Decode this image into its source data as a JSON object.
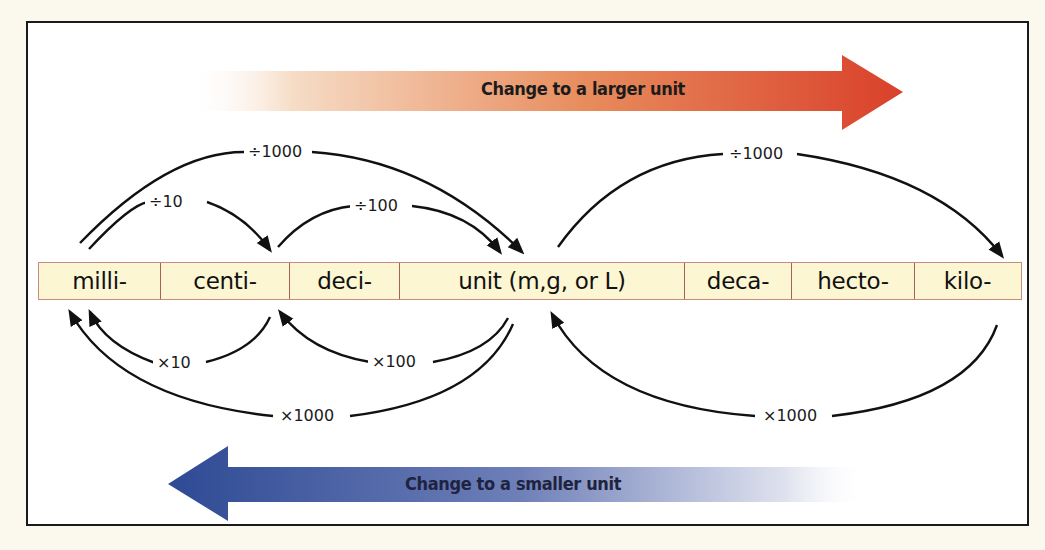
{
  "title_arrows": {
    "larger": {
      "label": "Change to a larger unit",
      "color": "#d9432a",
      "direction": "right"
    },
    "smaller": {
      "label": "Change to a smaller unit",
      "color": "#2e4a94",
      "direction": "left"
    }
  },
  "units": [
    {
      "label": "milli-"
    },
    {
      "label": "centi-"
    },
    {
      "label": "deci-"
    },
    {
      "label": "unit (m,g, or L)"
    },
    {
      "label": "deca-"
    },
    {
      "label": "hecto-"
    },
    {
      "label": "kilo-"
    }
  ],
  "conversions_top": [
    {
      "label": "÷1000",
      "from": "milli-",
      "to": "unit"
    },
    {
      "label": "÷10",
      "from": "milli-",
      "to": "centi-"
    },
    {
      "label": "÷100",
      "from": "centi-",
      "to": "unit"
    },
    {
      "label": "÷1000",
      "from": "unit",
      "to": "kilo-"
    }
  ],
  "conversions_bottom": [
    {
      "label": "×10",
      "from": "centi-",
      "to": "milli-"
    },
    {
      "label": "×100",
      "from": "unit",
      "to": "centi-"
    },
    {
      "label": "×1000",
      "from": "unit",
      "to": "milli-"
    },
    {
      "label": "×1000",
      "from": "kilo-",
      "to": "unit"
    }
  ]
}
